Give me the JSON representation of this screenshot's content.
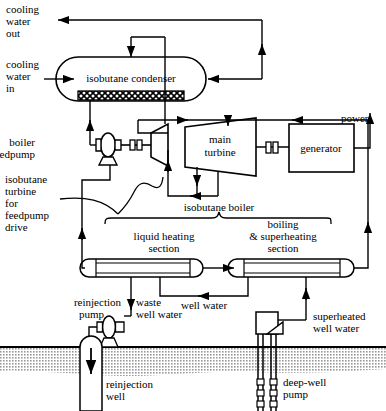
{
  "diagram": {
    "stroke_color": "#000000",
    "ground_color": "#bfbfbf",
    "background_color": "#ffffff"
  },
  "labels": {
    "cooling_water_out": "cooling\nwater\nout",
    "cooling_water_out_l1": "cooling",
    "cooling_water_out_l2": "water",
    "cooling_water_out_l3": "out",
    "cooling_water_in_l1": "cooling",
    "cooling_water_in_l2": "water",
    "cooling_water_in_l3": "in",
    "isobutane_condenser": "isobutane condenser",
    "power": "power",
    "generator": "generator",
    "main_turbine_l1": "main",
    "main_turbine_l2": "turbine",
    "boiler_feedpump_l1": "boiler",
    "boiler_feedpump_l2": "feedpump",
    "isobutane_turbine_l1": "isobutane",
    "isobutane_turbine_l2": "turbine",
    "isobutane_turbine_l3": "for",
    "isobutane_turbine_l4": "feedpump",
    "isobutane_turbine_l5": "drive",
    "isobutane_boiler": "isobutane boiler",
    "liquid_heating_l1": "liquid heating",
    "liquid_heating_l2": "section",
    "boiling_superheating_l1": "boiling",
    "boiling_superheating_l2": "& superheating",
    "boiling_superheating_l3": "section",
    "well_water": "well water",
    "reinjection_pump_l1": "reinjection",
    "reinjection_pump_l2": "pump",
    "waste_well_water_l1": "waste",
    "waste_well_water_l2": "well water",
    "superheated_well_water_l1": "superheated",
    "superheated_well_water_l2": "well water",
    "reinjection_well_l1": "reinjection",
    "reinjection_well_l2": "well",
    "deep_well_pump_l1": "deep-well",
    "deep_well_pump_l2": "pump"
  }
}
